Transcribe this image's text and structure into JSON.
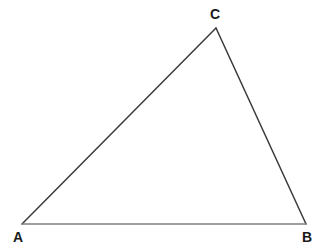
{
  "figure": {
    "kind": "geometry-diagram",
    "shape": "triangle",
    "background_color": "#ffffff",
    "width": 325,
    "height": 250
  },
  "chart_data": {
    "type": "scatter",
    "title": "",
    "xlabel": "",
    "ylabel": "",
    "grid": false,
    "legend": null,
    "xlim": [
      0,
      325
    ],
    "ylim": [
      0,
      250
    ],
    "vertices": [
      {
        "label": "A",
        "x": 22,
        "y": 224
      },
      {
        "label": "B",
        "x": 306,
        "y": 224
      },
      {
        "label": "C",
        "x": 216,
        "y": 28
      }
    ],
    "edges": [
      {
        "name": "AC",
        "from": "A",
        "to": "C",
        "color": "#3a3a3a",
        "width": 1.5
      },
      {
        "name": "CB",
        "from": "C",
        "to": "B",
        "color": "#3a3a3a",
        "width": 1.5
      },
      {
        "name": "AB",
        "from": "A",
        "to": "B",
        "color": "#808080",
        "width": 1.5
      }
    ]
  },
  "labels": {
    "vertex_a": "A",
    "vertex_b": "B",
    "vertex_c": "C"
  },
  "colors": {
    "edge_dark": "#3a3a3a",
    "edge_base": "#808080",
    "label": "#1a1a1a",
    "background": "#ffffff"
  }
}
